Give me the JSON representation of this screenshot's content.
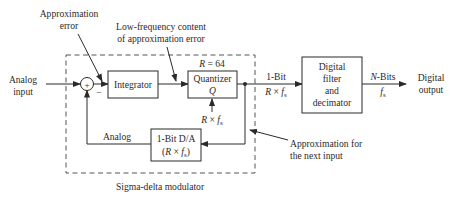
{
  "diagram": {
    "type": "block-diagram",
    "title": "Sigma-delta modulator",
    "inputs": {
      "analog_input": [
        "Analog",
        "input"
      ]
    },
    "outputs": {
      "digital_output": [
        "Digital",
        "output"
      ]
    },
    "annotations": {
      "approximation_error": [
        "Approximation",
        "error"
      ],
      "low_frequency_content": [
        "Low-frequency content",
        "of approximation error"
      ],
      "approximation_next_input": [
        "Approximation for",
        "the next input"
      ],
      "modulator_label": "Sigma-delta modulator"
    },
    "summing_junction": {
      "plus": "+",
      "minus": "−"
    },
    "blocks": {
      "integrator": {
        "label": "Integrator"
      },
      "quantizer": {
        "label": "Quantizer",
        "symbol": "Q",
        "param": "R = 64",
        "clock": "R × f",
        "clock_sub": "s"
      },
      "dac": {
        "line1": "1-Bit D/A",
        "line2_pre": "(R × f",
        "line2_sub": "s",
        "line2_post": ")"
      },
      "digital_filter": {
        "lines": [
          "Digital",
          "filter",
          "and",
          "decimator"
        ]
      }
    },
    "signals": {
      "one_bit": {
        "label": "1-Bit",
        "rate": "R × f",
        "rate_sub": "s"
      },
      "n_bits": {
        "label_italic": "N",
        "label": "-Bits",
        "rate": "f",
        "rate_sub": "s"
      },
      "analog_feedback": "Analog"
    }
  }
}
